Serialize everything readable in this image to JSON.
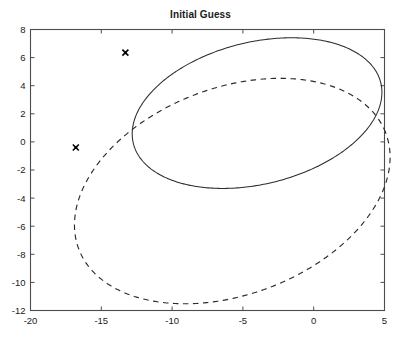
{
  "chart_data": {
    "type": "line",
    "title": "Initial Guess",
    "xlabel": "",
    "ylabel": "",
    "xlim": [
      -20,
      5
    ],
    "ylim": [
      -12,
      8
    ],
    "xticks": [
      -20,
      -15,
      -10,
      -5,
      0,
      5
    ],
    "xticklabels": [
      "-20",
      "-15",
      "-10",
      "-5",
      "0",
      "5"
    ],
    "yticks": [
      -12,
      -10,
      -8,
      -6,
      -4,
      -2,
      0,
      2,
      4,
      6,
      8
    ],
    "yticklabels": [
      "-12",
      "-10",
      "-8",
      "-6",
      "-4",
      "-2",
      "0",
      "2",
      "4",
      "6",
      "8"
    ],
    "grid": false,
    "legend": "none",
    "series": [
      {
        "name": "solid-orbit",
        "style": "solid",
        "color": "#2b2b2b",
        "shape": "ellipse",
        "center": [
          -4.0,
          2.05
        ],
        "semi_major": 9.0,
        "semi_minor": 5.05,
        "rotation_deg": 14.0,
        "marker": {
          "symbol": "x",
          "x": -13.3,
          "y": 6.35
        }
      },
      {
        "name": "dashed-orbit",
        "style": "dashed",
        "color": "#2b2b2b",
        "shape": "ellipse",
        "center": [
          -5.75,
          -3.5
        ],
        "semi_major": 11.6,
        "semi_minor": 7.35,
        "rotation_deg": 21.0,
        "marker": {
          "symbol": "x",
          "x": -16.8,
          "y": -0.4
        }
      }
    ],
    "annotations": []
  }
}
